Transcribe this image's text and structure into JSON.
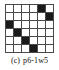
{
  "figure": {
    "caption_label": "(c)",
    "caption_name": "p6-1w5"
  },
  "chart_data": {
    "type": "heatmap",
    "rows": 6,
    "cols": 6,
    "xlabel": "",
    "ylabel": "",
    "legend": [],
    "grid": true,
    "colors": {
      "filled": "#1a1a1a",
      "empty": "#ffffff",
      "gridline": "#4a4a4a"
    },
    "categories": [
      "c1",
      "c2",
      "c3",
      "c4",
      "c5",
      "c6"
    ],
    "row_labels": [
      "r1",
      "r2",
      "r3",
      "r4",
      "r5",
      "r6"
    ],
    "values": [
      [
        0,
        0,
        0,
        0,
        1,
        0
      ],
      [
        0,
        0,
        0,
        0,
        0,
        1
      ],
      [
        1,
        0,
        0,
        0,
        0,
        0
      ],
      [
        0,
        1,
        0,
        0,
        0,
        0
      ],
      [
        0,
        0,
        1,
        0,
        0,
        0
      ],
      [
        0,
        0,
        0,
        1,
        0,
        0
      ]
    ],
    "filled_cells": [
      {
        "row": 1,
        "col": 5
      },
      {
        "row": 2,
        "col": 6
      },
      {
        "row": 3,
        "col": 1
      },
      {
        "row": 4,
        "col": 2
      },
      {
        "row": 5,
        "col": 3
      },
      {
        "row": 6,
        "col": 4
      }
    ],
    "filled_count": 6
  }
}
